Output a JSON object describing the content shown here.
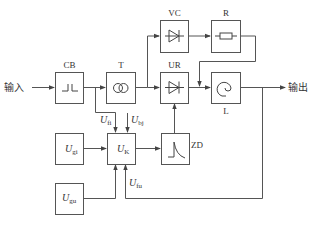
{
  "diagram": {
    "input_label": "输入",
    "output_label": "输出",
    "blocks": {
      "cb": {
        "label": "CB"
      },
      "t": {
        "label": "T"
      },
      "vc": {
        "label": "VC"
      },
      "r": {
        "label": "R"
      },
      "ur": {
        "label": "UR"
      },
      "l": {
        "label": "L"
      },
      "zd": {
        "label": "ZD"
      },
      "ugi": {
        "main": "U",
        "sub": "gi"
      },
      "uk": {
        "main": "U",
        "sub": "K"
      },
      "ugu": {
        "main": "U",
        "sub": "gu"
      }
    },
    "signals": {
      "ufi": {
        "main": "U",
        "sub": "fi"
      },
      "ubj": {
        "main": "U",
        "sub": "bj"
      },
      "ufu": {
        "main": "U",
        "sub": "fu"
      }
    },
    "colors": {
      "line": "#555555",
      "text": "#333333",
      "background": "#ffffff"
    }
  }
}
